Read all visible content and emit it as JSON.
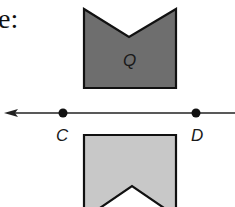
{
  "caption": "e:",
  "diagram": {
    "type": "reflection",
    "preimage": {
      "label": "Q",
      "fill": "#6e6e6e",
      "points": [
        [
          84,
          9
        ],
        [
          129,
          37
        ],
        [
          176,
          9
        ],
        [
          176,
          88
        ],
        [
          84,
          88
        ]
      ]
    },
    "image": {
      "label": "",
      "fill": "#c8c8c8",
      "points": [
        [
          84,
          135
        ],
        [
          176,
          135
        ],
        [
          176,
          207
        ],
        [
          84,
          207
        ]
      ],
      "notch": [
        [
          97,
          207
        ],
        [
          132,
          186
        ],
        [
          167,
          207
        ]
      ]
    },
    "line": {
      "y": 113,
      "x_start": 5,
      "x_end": 235,
      "arrow": "left"
    },
    "points": [
      {
        "label": "C",
        "x": 63,
        "y": 113,
        "label_x": 57,
        "label_y": 140
      },
      {
        "label": "D",
        "x": 196,
        "y": 113,
        "label_x": 192,
        "label_y": 140
      }
    ]
  }
}
